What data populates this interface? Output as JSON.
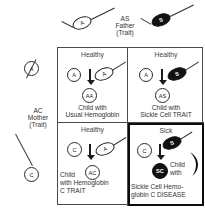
{
  "diagram": {
    "title_semantic": "sickle-cell-hemoglobin-c-inheritance-punnett",
    "father": {
      "label_lines": [
        "AS",
        "Father",
        "(Trait)"
      ],
      "gametes": [
        {
          "allele": "A",
          "style": "outline"
        },
        {
          "allele": "S",
          "style": "filled"
        }
      ]
    },
    "mother": {
      "label_lines": [
        "AC",
        "Mother",
        "(Trait)"
      ],
      "gametes": [
        {
          "allele": "A",
          "style": "outline"
        },
        {
          "allele": "C",
          "style": "bold-outline"
        }
      ]
    },
    "quadrants": [
      {
        "position": "top-left",
        "status": "Healthy",
        "egg_allele": "A",
        "sperm_allele": "A",
        "sperm_style": "outline",
        "child_genotype": "AA",
        "child_style": "outline",
        "caption_lines": [
          "Child with",
          "Usual Hemoglobin"
        ],
        "emphasis": false,
        "sickle_cell_icon": false
      },
      {
        "position": "top-right",
        "status": "Healthy",
        "egg_allele": "A",
        "sperm_allele": "S",
        "sperm_style": "filled",
        "child_genotype": "AS",
        "child_style": "outline",
        "caption_lines": [
          "Child with",
          "Sickle Cell TRAIT"
        ],
        "emphasis": false,
        "sickle_cell_icon": false
      },
      {
        "position": "bottom-left",
        "status": "Healthy",
        "egg_allele": "C",
        "sperm_allele": "A",
        "sperm_style": "outline",
        "child_genotype": "AC",
        "child_style": "outline",
        "caption_lines": [
          "Child",
          "with Hemoglobin",
          "C TRAIT"
        ],
        "emphasis": false,
        "sickle_cell_icon": false
      },
      {
        "position": "bottom-right",
        "status": "Sick",
        "egg_allele": "C",
        "sperm_allele": "S",
        "sperm_style": "filled",
        "child_genotype": "SC",
        "child_style": "filled",
        "caption_lines": [
          "Child",
          "with"
        ],
        "caption_bottom_lines": [
          "Sickle Cell  Hemo-",
          "globin C DISEASE"
        ],
        "emphasis": true,
        "sickle_cell_icon": true
      }
    ],
    "colors": {
      "ink": "#1a1a1a",
      "fill_black": "#111111",
      "paper": "#ffffff",
      "rule": "#4a4a4a",
      "emphasis_rule": "#0d0d0d"
    }
  }
}
